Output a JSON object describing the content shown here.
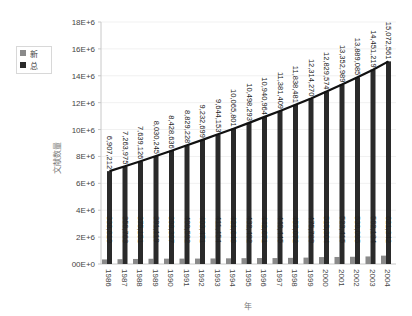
{
  "chart_data": {
    "type": "bar",
    "title": "",
    "xlabel": "年",
    "ylabel": "文献数量",
    "ylim": [
      0,
      18000000
    ],
    "yticks": [
      "00E+0",
      "2E+6",
      "4E+6",
      "6E+6",
      "8E+6",
      "10E+6",
      "12E+6",
      "14E+6",
      "16E+6",
      "18E+6"
    ],
    "grid": true,
    "legend_position": "left",
    "categories": [
      "1986",
      "1987",
      "1988",
      "1989",
      "1990",
      "1991",
      "1992",
      "1993",
      "1994",
      "1995",
      "1996",
      "1997",
      "1998",
      "1999",
      "2000",
      "2001",
      "2002",
      "2003",
      "2004"
    ],
    "series": [
      {
        "name": "新",
        "type": "bar",
        "color": "#8a8a8a",
        "values": [
          338819,
          356763,
          375151,
          391119,
          398397,
          400592,
          403471,
          411454,
          421648,
          432492,
          442671,
          440445,
          457072,
          475789,
          515304,
          523415,
          538095,
          562134,
          621342
        ],
        "labels": [
          "338,819",
          "356,763",
          "375,151",
          "391,119",
          "398,397",
          "400,592",
          "403,471",
          "411,454",
          "421,648",
          "432,492",
          "442,671",
          "440,445",
          "457,072",
          "475,789",
          "515,304",
          "523,415",
          "538,095",
          "562,134",
          "621,342"
        ]
      },
      {
        "name": "总",
        "type": "bar+line",
        "color": "#2a2a2a",
        "values": [
          6907212,
          7263975,
          7639126,
          8030245,
          8428636,
          8829228,
          9232699,
          9644153,
          10065801,
          10498293,
          10940964,
          11381409,
          11838481,
          12314270,
          12829574,
          13352989,
          13889085,
          14451219,
          15072561
        ],
        "labels": [
          "6,907,212",
          "7,263,975",
          "7,639,126",
          "8,030,245",
          "8,428,636",
          "8,829,228",
          "9,232,699",
          "9,644,153",
          "10,065,801",
          "10,498,293",
          "10,940,964",
          "11,381,409",
          "11,838,481",
          "12,314,270",
          "12,829,574",
          "13,352,989",
          "13,889,085",
          "14,451,219",
          "15,072,561"
        ]
      }
    ]
  },
  "legend": {
    "items": [
      {
        "label": "新",
        "color": "#8a8a8a"
      },
      {
        "label": "总",
        "color": "#2a2a2a"
      }
    ]
  },
  "axes": {
    "x_title": "年",
    "y_title": "文献数量"
  }
}
